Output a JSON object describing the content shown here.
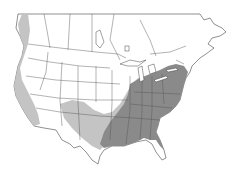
{
  "map": {
    "region": "North America (United States and southern Canada)",
    "type": "species range map",
    "legend": [],
    "colors": {
      "background": "#ffffff",
      "land": "#ffffff",
      "borders": "#444444",
      "core_range": "#8a8a8a",
      "peripheral_range": "#c4c4c4"
    },
    "ranges": [
      {
        "name": "core-range",
        "description": "Eastern United States from Great Lakes/New England south to Gulf coast and northern Florida, west to eastern Texas"
      },
      {
        "name": "peripheral-range",
        "description": "Band from central Texas through New Mexico/Arizona, plus Pacific coast from Washington to southern California"
      }
    ]
  }
}
